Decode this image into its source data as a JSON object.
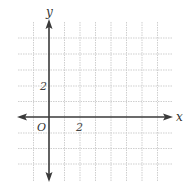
{
  "diagram": {
    "type": "coordinate-plane",
    "axes": {
      "x_label": "x",
      "y_label": "y",
      "origin_label": "O",
      "x_tick_label": "2",
      "y_tick_label": "2"
    },
    "grid": {
      "step_units": 1,
      "x_min": -2,
      "x_max": 8,
      "y_min": -4,
      "y_max": 6
    },
    "colors": {
      "grid": "#c8c8c8",
      "axis": "#3a3a3a",
      "text": "#333333"
    }
  }
}
